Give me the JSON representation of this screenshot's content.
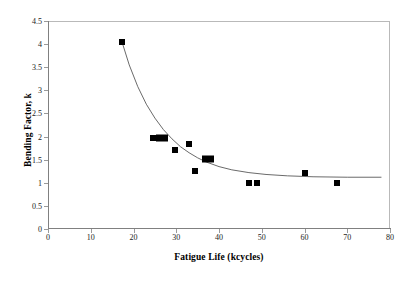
{
  "chart_data": {
    "type": "scatter",
    "title": "",
    "xlabel": "Fatigue Life (kcycles)",
    "ylabel": "Bending Factor, k",
    "xlim": [
      0,
      80
    ],
    "ylim": [
      0,
      4.5
    ],
    "xticks": [
      0,
      10,
      20,
      30,
      40,
      50,
      60,
      70,
      80
    ],
    "yticks": [
      0,
      0.5,
      1,
      1.5,
      2,
      2.5,
      3,
      3.5,
      4,
      4.5
    ],
    "xtick_labels": [
      "0",
      "10",
      "20",
      "30",
      "40",
      "50",
      "60",
      "70",
      "80"
    ],
    "ytick_labels": [
      "0",
      "0.5",
      "1",
      "1.5",
      "2",
      "2.5",
      "3",
      "3.5",
      "4",
      "4.5"
    ],
    "grid": false,
    "legend": false,
    "marker_style": "filled-square",
    "marker_color": "#000000",
    "curve_color": "#595959",
    "frame_color": "#b9b9b9",
    "series": [
      {
        "name": "measured",
        "points": [
          {
            "x": 17.3,
            "y": 4.05,
            "wide": false
          },
          {
            "x": 24.6,
            "y": 1.97,
            "wide": false
          },
          {
            "x": 26.6,
            "y": 1.97,
            "wide": true
          },
          {
            "x": 29.8,
            "y": 1.7,
            "wide": false
          },
          {
            "x": 33.0,
            "y": 1.83,
            "wide": false
          },
          {
            "x": 34.5,
            "y": 1.25,
            "wide": false
          },
          {
            "x": 37.5,
            "y": 1.52,
            "wide": true
          },
          {
            "x": 47.0,
            "y": 1.0,
            "wide": false
          },
          {
            "x": 49.0,
            "y": 1.0,
            "wide": false
          },
          {
            "x": 60.0,
            "y": 1.22,
            "wide": false
          },
          {
            "x": 67.5,
            "y": 1.0,
            "wide": false
          }
        ]
      },
      {
        "name": "fitted-curve",
        "kind": "line",
        "points": [
          {
            "x": 17.3,
            "y": 4.05
          },
          {
            "x": 19.0,
            "y": 3.55
          },
          {
            "x": 21.0,
            "y": 3.08
          },
          {
            "x": 23.0,
            "y": 2.7
          },
          {
            "x": 25.0,
            "y": 2.4
          },
          {
            "x": 27.0,
            "y": 2.15
          },
          {
            "x": 29.0,
            "y": 1.95
          },
          {
            "x": 31.0,
            "y": 1.78
          },
          {
            "x": 33.0,
            "y": 1.65
          },
          {
            "x": 35.0,
            "y": 1.54
          },
          {
            "x": 37.0,
            "y": 1.45
          },
          {
            "x": 40.0,
            "y": 1.35
          },
          {
            "x": 43.0,
            "y": 1.28
          },
          {
            "x": 47.0,
            "y": 1.22
          },
          {
            "x": 51.0,
            "y": 1.18
          },
          {
            "x": 56.0,
            "y": 1.15
          },
          {
            "x": 62.0,
            "y": 1.13
          },
          {
            "x": 70.0,
            "y": 1.12
          },
          {
            "x": 78.0,
            "y": 1.12
          }
        ]
      }
    ]
  }
}
